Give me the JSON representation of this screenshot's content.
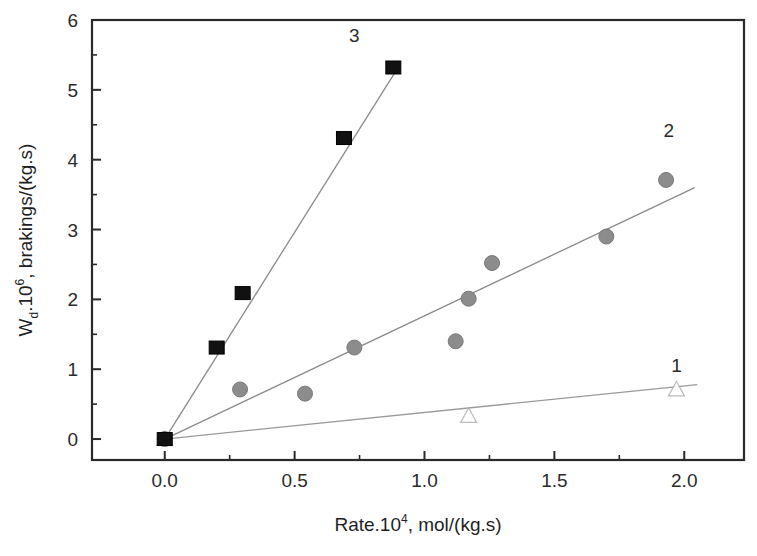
{
  "chart_data": {
    "type": "scatter",
    "title": "",
    "xlabel": "Rate.10^4, mol/(kg.s)",
    "xlabel_main": "Rate.10",
    "xlabel_sup": "4",
    "xlabel_rest": ", mol/(kg.s)",
    "ylabel": "W_d .10^6, brakings/(kg.s)",
    "ylabel_main": "W",
    "ylabel_sub": "d",
    "ylabel_mid": ".10",
    "ylabel_sup": "6",
    "ylabel_rest": ", brakings/(kg.s)",
    "xlim": [
      -0.28,
      2.23
    ],
    "ylim": [
      -0.3,
      6.0
    ],
    "xticks": [
      0.0,
      0.5,
      1.0,
      1.5,
      2.0
    ],
    "xtick_labels": [
      "0.0",
      "0.5",
      "1.0",
      "1.5",
      "2.0"
    ],
    "yticks": [
      0,
      1,
      2,
      3,
      4,
      5,
      6
    ],
    "ytick_labels": [
      "0",
      "1",
      "2",
      "3",
      "4",
      "5",
      "6"
    ],
    "minor_xticks": [
      0.25,
      0.75,
      1.25,
      1.75
    ],
    "minor_yticks": [
      0.5,
      1.5,
      2.5,
      3.5,
      4.5,
      5.5
    ],
    "grid": false,
    "legend_position": "inline-end-of-line",
    "frame": true,
    "series": [
      {
        "name": "1",
        "label": "1",
        "marker": "open-triangle",
        "color": "#d9d9d9",
        "edge_color": "#b0b0b0",
        "line_color": "#9a9a9a",
        "label_x": 1.97,
        "label_y": 0.96,
        "points": [
          {
            "x": 0.0,
            "y": 0.0
          },
          {
            "x": 1.17,
            "y": 0.33
          },
          {
            "x": 1.97,
            "y": 0.71
          }
        ],
        "fit_line": {
          "x0": 0.0,
          "y0": 0.0,
          "x1": 2.05,
          "y1": 0.78
        }
      },
      {
        "name": "2",
        "label": "2",
        "marker": "filled-circle",
        "color": "#8c8c8c",
        "edge_color": "#7a7a7a",
        "line_color": "#8a8a8a",
        "label_x": 1.94,
        "label_y": 4.33,
        "points": [
          {
            "x": 0.0,
            "y": 0.0
          },
          {
            "x": 0.29,
            "y": 0.71
          },
          {
            "x": 0.54,
            "y": 0.65
          },
          {
            "x": 0.73,
            "y": 1.31
          },
          {
            "x": 1.12,
            "y": 1.4
          },
          {
            "x": 1.17,
            "y": 2.01
          },
          {
            "x": 1.26,
            "y": 2.52
          },
          {
            "x": 1.7,
            "y": 2.9
          },
          {
            "x": 1.93,
            "y": 3.71
          }
        ],
        "fit_line": {
          "x0": 0.0,
          "y0": 0.0,
          "x1": 2.04,
          "y1": 3.6
        }
      },
      {
        "name": "3",
        "label": "3",
        "marker": "filled-square",
        "color": "#111111",
        "edge_color": "#000000",
        "line_color": "#8a8a8a",
        "label_x": 0.73,
        "label_y": 5.68,
        "points": [
          {
            "x": 0.0,
            "y": 0.0
          },
          {
            "x": 0.2,
            "y": 1.31
          },
          {
            "x": 0.3,
            "y": 2.09
          },
          {
            "x": 0.69,
            "y": 4.31
          },
          {
            "x": 0.88,
            "y": 5.32
          }
        ],
        "fit_line": {
          "x0": 0.0,
          "y0": 0.0,
          "x1": 0.9,
          "y1": 5.33
        }
      }
    ]
  }
}
